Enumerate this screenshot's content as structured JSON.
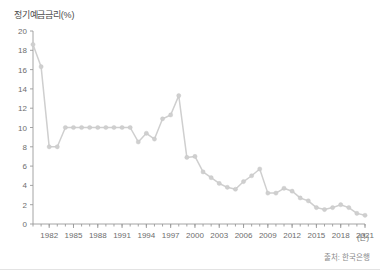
{
  "chart_data": {
    "type": "line",
    "title": "정기예금금리(%)",
    "xlabel": "(년)",
    "ylabel": "",
    "source": "출처: 한국은행",
    "grid": false,
    "legend": null,
    "ylim": [
      0,
      20
    ],
    "xlim": [
      1980,
      2021
    ],
    "ytick_values": [
      0,
      2,
      4,
      6,
      8,
      10,
      12,
      14,
      16,
      18,
      20
    ],
    "ytick_labels": [
      "0",
      "2",
      "4",
      "6",
      "8",
      "10",
      "12",
      "14",
      "16",
      "18",
      "20"
    ],
    "xtick_values": [
      1982,
      1985,
      1988,
      1991,
      1994,
      1997,
      2000,
      2003,
      2006,
      2009,
      2012,
      2015,
      2018,
      2021
    ],
    "xtick_labels": [
      "1982",
      "1985",
      "1988",
      "1991",
      "1994",
      "1997",
      "2000",
      "2003",
      "2006",
      "2009",
      "2012",
      "2015",
      "2018",
      "2021"
    ],
    "series_color": "#cfcfcf",
    "x": [
      1980,
      1981,
      1982,
      1983,
      1984,
      1985,
      1986,
      1987,
      1988,
      1989,
      1990,
      1991,
      1992,
      1993,
      1994,
      1995,
      1996,
      1997,
      1998,
      1999,
      2000,
      2001,
      2002,
      2003,
      2004,
      2005,
      2006,
      2007,
      2008,
      2009,
      2010,
      2011,
      2012,
      2013,
      2014,
      2015,
      2016,
      2017,
      2018,
      2019,
      2020,
      2021
    ],
    "values": [
      18.6,
      16.3,
      8.0,
      8.0,
      10.0,
      10.0,
      10.0,
      10.0,
      10.0,
      10.0,
      10.0,
      10.0,
      10.0,
      8.5,
      9.4,
      8.8,
      10.9,
      11.3,
      13.3,
      6.9,
      7.0,
      5.4,
      4.8,
      4.2,
      3.8,
      3.6,
      4.4,
      5.0,
      5.7,
      3.2,
      3.2,
      3.7,
      3.4,
      2.7,
      2.4,
      1.7,
      1.5,
      1.7,
      2.0,
      1.7,
      1.1,
      0.9
    ]
  },
  "figure": {
    "background": "#ffffff",
    "axis_color": "#9a9a9a",
    "tick_label_color": "#6d6d6d",
    "title_color": "#4a4a4a",
    "source_color": "#8a8a8a"
  }
}
